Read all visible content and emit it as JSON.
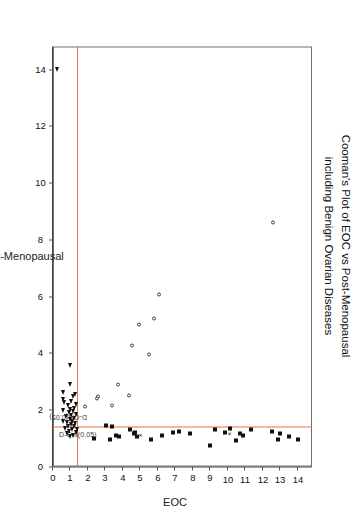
{
  "chart_data": {
    "type": "scatter",
    "title": "Cooman's Plot of EOC vs Post-Menopausal",
    "subtitle": "including Benign Ovarian Diseases",
    "xlabel": "Post-Menopausal",
    "ylabel": "EOC",
    "xlim": [
      0,
      14.8
    ],
    "ylim": [
      0,
      14.8
    ],
    "xticks": [
      0,
      2,
      4,
      6,
      8,
      10,
      12,
      14
    ],
    "yticks": [
      0,
      1,
      2,
      3,
      4,
      5,
      6,
      7,
      8,
      9,
      10,
      11,
      12,
      13,
      14
    ],
    "grid": false,
    "legend_position": "none",
    "accent_color": "#e8733f",
    "marker_color": "#111111",
    "annotations": [
      {
        "text": "D-Crit(0.05)",
        "axis": "y",
        "value": 1.42,
        "orientation": "along-eoc"
      },
      {
        "text": "D-Crit(0.05)",
        "axis": "x",
        "value": 1.42,
        "orientation": "along-postmeno"
      }
    ],
    "critical_lines": {
      "label": "D-Crit(0.05)",
      "x_value": 1.42,
      "y_value": 1.42,
      "color": "#e8733f"
    },
    "series": [
      {
        "name": "EOC",
        "marker": "filled-square",
        "points": [
          [
            0.95,
            14.0
          ],
          [
            1.05,
            13.5
          ],
          [
            1.15,
            13.0
          ],
          [
            0.95,
            12.85
          ],
          [
            1.25,
            12.5
          ],
          [
            1.3,
            11.3
          ],
          [
            1.1,
            10.85
          ],
          [
            1.15,
            10.7
          ],
          [
            0.9,
            10.45
          ],
          [
            1.35,
            10.1
          ],
          [
            1.2,
            9.85
          ],
          [
            1.3,
            9.25
          ],
          [
            0.75,
            8.95
          ],
          [
            1.15,
            7.85
          ],
          [
            1.25,
            7.2
          ],
          [
            1.2,
            6.85
          ],
          [
            1.1,
            6.25
          ],
          [
            0.95,
            5.6
          ],
          [
            1.05,
            4.8
          ],
          [
            1.2,
            4.7
          ],
          [
            1.15,
            4.62
          ],
          [
            1.3,
            4.42
          ],
          [
            1.05,
            3.75
          ],
          [
            1.1,
            3.62
          ],
          [
            1.4,
            3.35
          ],
          [
            0.95,
            3.25
          ],
          [
            1.45,
            3.05
          ],
          [
            1.0,
            2.35
          ]
        ]
      },
      {
        "name": "Benign Ovarian Disease",
        "marker": "open-circle",
        "points": [
          [
            8.6,
            12.6
          ],
          [
            6.05,
            6.05
          ],
          [
            5.2,
            5.75
          ],
          [
            3.95,
            5.5
          ],
          [
            5.0,
            4.9
          ],
          [
            4.25,
            4.5
          ],
          [
            2.5,
            4.35
          ],
          [
            2.9,
            3.7
          ],
          [
            2.15,
            3.4
          ],
          [
            2.45,
            2.6
          ],
          [
            2.4,
            2.5
          ],
          [
            2.1,
            1.85
          ]
        ]
      },
      {
        "name": "Post-Menopausal",
        "marker": "filled-triangle",
        "points": [
          [
            14.0,
            0.25
          ],
          [
            3.55,
            0.95
          ],
          [
            2.9,
            0.95
          ],
          [
            2.55,
            1.25
          ],
          [
            2.45,
            1.15
          ],
          [
            2.3,
            1.05
          ],
          [
            2.2,
            1.3
          ],
          [
            2.15,
            0.85
          ],
          [
            2.05,
            1.2
          ],
          [
            2.0,
            1.0
          ],
          [
            1.95,
            1.15
          ],
          [
            1.9,
            0.9
          ],
          [
            1.85,
            1.3
          ],
          [
            1.8,
            1.05
          ],
          [
            1.75,
            0.75
          ],
          [
            1.7,
            1.22
          ],
          [
            1.65,
            0.95
          ],
          [
            1.6,
            1.1
          ],
          [
            1.55,
            0.8
          ],
          [
            1.5,
            1.28
          ],
          [
            1.48,
            1.02
          ],
          [
            1.42,
            0.88
          ],
          [
            1.4,
            1.18
          ],
          [
            1.35,
            0.7
          ],
          [
            1.3,
            1.08
          ],
          [
            1.25,
            0.92
          ],
          [
            1.2,
            1.3
          ],
          [
            1.15,
            0.78
          ],
          [
            1.1,
            1.12
          ],
          [
            1.05,
            0.98
          ],
          [
            2.6,
            0.6
          ],
          [
            2.35,
            0.55
          ],
          [
            2.25,
            0.62
          ],
          [
            1.98,
            0.58
          ],
          [
            1.6,
            0.6
          ],
          [
            1.3,
            1.35
          ]
        ]
      },
      {
        "name": "Outlier",
        "marker": "cross",
        "points": [
          [
            1.15,
            10.05
          ],
          [
            1.1,
            4.95
          ]
        ]
      }
    ]
  }
}
